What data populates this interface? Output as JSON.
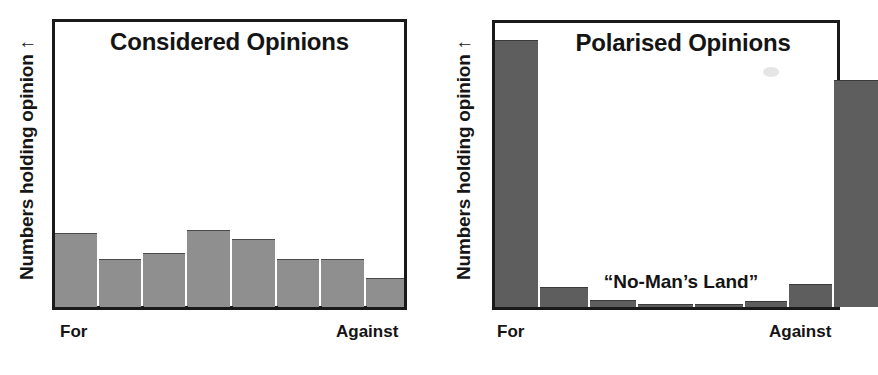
{
  "page": {
    "background": "#ffffff",
    "bar_fill_light": "#8f8f8f",
    "bar_fill_dark": "#5e5e5e",
    "frame_color": "#1a1a1a",
    "text_color": "#141414"
  },
  "charts": [
    {
      "id": "considered-opinions",
      "title": "Considered Opinions",
      "ylabel": "Numbers holding opinion ↑",
      "x_left_label": "For",
      "x_right_label": "Against",
      "annotation": ""
    },
    {
      "id": "polarised-opinions",
      "title": "Polarised Opinions",
      "ylabel": "Numbers holding opinion ↑",
      "x_left_label": "For",
      "x_right_label": "Against",
      "annotation": "“No-Man’s Land”"
    }
  ],
  "chart_data": [
    {
      "type": "bar",
      "title": "Considered Opinions",
      "xlabel": "",
      "ylabel": "Numbers holding opinion ↑",
      "categories": [
        "For",
        "2",
        "3",
        "4",
        "5",
        "6",
        "7",
        "Against"
      ],
      "values": [
        26,
        17,
        19,
        27,
        24,
        17,
        17,
        10
      ],
      "ylim": [
        0,
        100
      ],
      "grid": false,
      "legend": false,
      "axis_tick_labels": {
        "left": "For",
        "right": "Against"
      },
      "bar_color": "#8f8f8f",
      "note": "Values are percentages of full plot height estimated from pixel bar tops; a broad, fairly even spread across the opinion range."
    },
    {
      "type": "bar",
      "title": "Polarised Opinions",
      "xlabel": "",
      "ylabel": "Numbers holding opinion ↑",
      "categories": [
        "For",
        "2",
        "3",
        "4",
        "5",
        "6",
        "7",
        "Against"
      ],
      "values": [
        94,
        7,
        2.5,
        1,
        1,
        2,
        8,
        80
      ],
      "ylim": [
        0,
        100
      ],
      "grid": false,
      "legend": false,
      "axis_tick_labels": {
        "left": "For",
        "right": "Against"
      },
      "annotations": [
        {
          "text": "“No-Man’s Land”",
          "x_frac": 0.5,
          "y_frac": 0.22
        }
      ],
      "bar_color": "#5e5e5e",
      "note": "U-shaped / bimodal distribution: extreme 'For' and 'Against' dominate, middle is near-empty."
    }
  ]
}
